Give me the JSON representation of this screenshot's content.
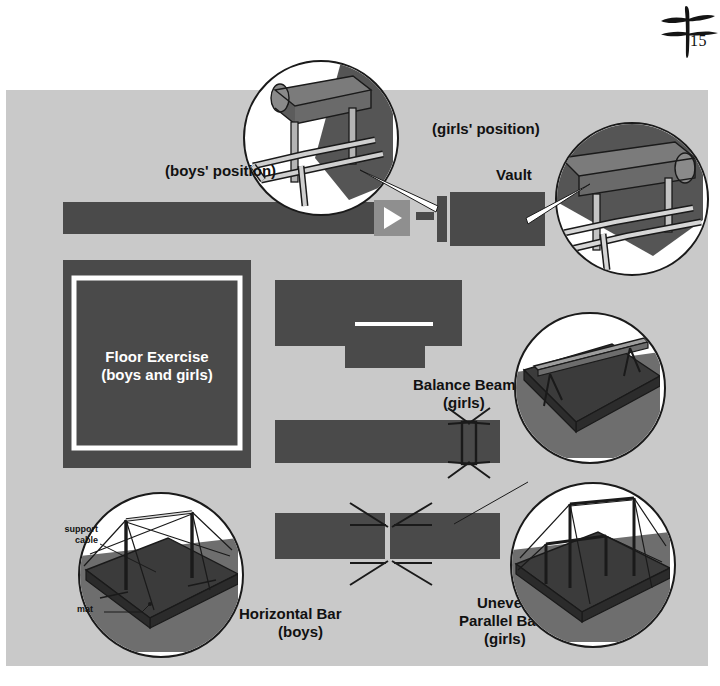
{
  "page": {
    "number": "15",
    "ornament_icon": "brush-stroke-ornament-icon",
    "background_color": "#ffffff",
    "panel_color": "#c9c9c9",
    "mat_color": "#4a4a4a",
    "accent_color": "#8f8f8f",
    "line_color": "#ffffff"
  },
  "labels": {
    "boys_position": "(boys' position)",
    "girls_position": "(girls' position)",
    "vault": "Vault",
    "floor_exercise": "Floor Exercise",
    "floor_exercise_sub": "(boys and girls)",
    "balance_beam": "Balance Beam",
    "balance_beam_sub": "(girls)",
    "horizontal_bar": "Horizontal Bar",
    "horizontal_bar_sub": "(boys)",
    "uneven_bars_line1": "Uneven",
    "uneven_bars_line2": "Parallel Bars",
    "uneven_bars_sub": "(girls)",
    "support_cable": "support\ncable",
    "mat": "mat"
  },
  "apparatus": [
    {
      "name": "Vault",
      "genders": "boys and girls",
      "plan_elements": [
        "runway",
        "springboard",
        "vault-table",
        "landing-mat"
      ],
      "insets": [
        "boys-position-vault-inset",
        "girls-position-vault-inset"
      ]
    },
    {
      "name": "Floor Exercise",
      "genders": "boys and girls",
      "plan_elements": [
        "floor-square",
        "inner-boundary-line"
      ],
      "insets": []
    },
    {
      "name": "Balance Beam",
      "genders": "girls",
      "plan_elements": [
        "cross-mat",
        "beam-line"
      ],
      "insets": [
        "balance-beam-inset"
      ]
    },
    {
      "name": "Horizontal Bar",
      "genders": "boys",
      "plan_elements": [
        "landing-mat",
        "bar",
        "support-cables"
      ],
      "insets": [
        "horizontal-bar-inset"
      ]
    },
    {
      "name": "Uneven Parallel Bars",
      "genders": "girls",
      "plan_elements": [
        "landing-mat-split",
        "support-cables"
      ],
      "insets": [
        "uneven-parallel-bars-inset"
      ]
    }
  ]
}
